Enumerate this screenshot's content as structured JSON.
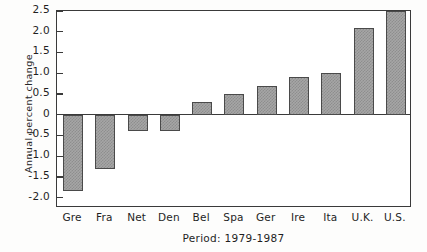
{
  "chart_data": {
    "type": "bar",
    "title": "",
    "subtitle": "",
    "xlabel": "Period: 1979-1987",
    "ylabel": "Annual percent change",
    "categories": [
      "Gre",
      "Fra",
      "Net",
      "Den",
      "Bel",
      "Spa",
      "Ger",
      "Ire",
      "Ita",
      "U.K.",
      "U.S."
    ],
    "values": [
      -1.85,
      -1.3,
      -0.4,
      -0.4,
      0.3,
      0.5,
      0.7,
      0.9,
      1.0,
      2.1,
      2.5
    ],
    "ylim": [
      -2.0,
      2.5
    ],
    "ytick_values": [
      2.5,
      2.0,
      1.5,
      1.0,
      0.5,
      0,
      -0.5,
      -1.0,
      -1.5,
      -2.0
    ],
    "ytick_labels": [
      "2.5",
      "2.0",
      "1.5",
      "1.0",
      "0.5",
      "0",
      "-0.5",
      "-1.0",
      "-1.5",
      "-2.0"
    ],
    "grid": false,
    "legend": null,
    "legend_position": "none",
    "bar_fill_color": "#a6a6a6",
    "bar_edge_color": "#4a4a4a",
    "axis_color": "#3a3a3a",
    "background_color": "#ffffff"
  },
  "axes": {
    "y_title": "Annual percent change",
    "x_caption": "Period: 1979-1987"
  }
}
